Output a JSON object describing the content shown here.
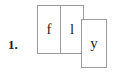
{
  "item": {
    "number_label": "1."
  },
  "tiles": [
    {
      "letter": "f",
      "position": "left"
    },
    {
      "letter": "l",
      "position": "middle"
    },
    {
      "letter": "y",
      "position": "right-offset"
    }
  ],
  "word": "fly",
  "colors": {
    "background": "#ffffff",
    "tile_border": "#9a9a9a",
    "tile_fill": "#ffffff",
    "text": "#1f1f1f",
    "number_text": "#1a1a1a"
  }
}
